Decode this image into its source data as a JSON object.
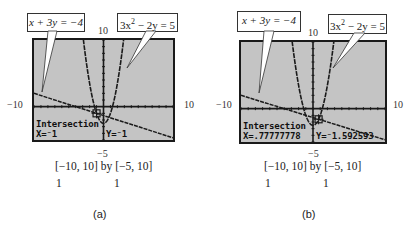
{
  "callouts": {
    "line_equation": "x + 3y = −4",
    "parabola_equation_base": "3x",
    "parabola_equation_exp": "2",
    "parabola_equation_rest": " − 2y = 5"
  },
  "axis_labels": {
    "y_max": "10",
    "y_min": "−5",
    "x_min": "−10",
    "x_max": "10"
  },
  "window": {
    "range_text": "[−10, 10]  by  [−5, 10]",
    "xscl": 1,
    "yscl": 1,
    "xmin": -10,
    "xmax": 10,
    "ymin": -5,
    "ymax": 10
  },
  "panels": [
    {
      "label": "(a)",
      "mode": "Intersection",
      "x_readout": "X=⁻1",
      "y_readout": "Y=⁻1",
      "cursor": {
        "x": -1,
        "y": -1
      }
    },
    {
      "label": "(b)",
      "mode": "Intersection",
      "x_readout": "X=.77777778",
      "y_readout": "Y=⁻1.592593",
      "cursor": {
        "x": 0.7777778,
        "y": -1.592593
      }
    }
  ],
  "colors": {
    "screen_bg": "#c4c4c4",
    "ink": "#1a1a1a",
    "page_bg": "#ffffff"
  },
  "chart_data": {
    "type": "line",
    "xlabel": "x",
    "ylabel": "y",
    "xlim": [
      -10,
      10
    ],
    "ylim": [
      -5,
      10
    ],
    "series": [
      {
        "name": "x + 3y = −4",
        "equation": "y = (−4 − x)/3"
      },
      {
        "name": "3x² − 2y = 5",
        "equation": "y = (3x² − 5)/2"
      }
    ],
    "intersections": [
      {
        "panel": "a",
        "x": -1,
        "y": -1
      },
      {
        "panel": "b",
        "x": 0.77777778,
        "y": -1.592593
      }
    ]
  }
}
